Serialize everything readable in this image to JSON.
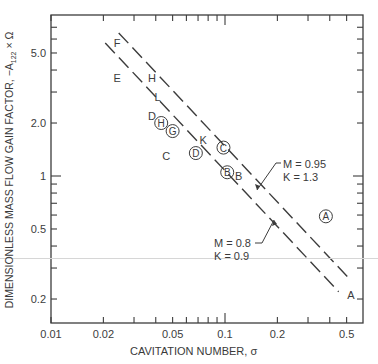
{
  "chart_data": {
    "type": "scatter",
    "title": "",
    "xlabel": "CAVITATION NUMBER, σ",
    "ylabel": "DIMENSIONLESS MASS FLOW GAIN FACTOR, −A122 × Ω",
    "xscale": "log",
    "yscale": "log",
    "xlim": [
      0.01,
      0.6
    ],
    "ylim": [
      0.16,
      8.0
    ],
    "x_ticks": [
      "0.01",
      "0.02",
      "0.05",
      "0.1",
      "0.2",
      "0.5"
    ],
    "y_ticks": [
      "0.2",
      "0.5",
      "1",
      "2.0",
      "5.0"
    ],
    "grid": false,
    "points": [
      {
        "label": "F",
        "circled": false,
        "x": 0.024,
        "y": 5.7
      },
      {
        "label": "E",
        "circled": false,
        "x": 0.024,
        "y": 3.6
      },
      {
        "label": "H",
        "circled": false,
        "x": 0.038,
        "y": 3.6
      },
      {
        "label": "L",
        "circled": false,
        "x": 0.041,
        "y": 2.8
      },
      {
        "label": "D",
        "circled": false,
        "x": 0.038,
        "y": 2.2
      },
      {
        "label": "H",
        "circled": true,
        "x": 0.043,
        "y": 2.0
      },
      {
        "label": "G",
        "circled": true,
        "x": 0.05,
        "y": 1.8
      },
      {
        "label": "K",
        "circled": false,
        "x": 0.075,
        "y": 1.6
      },
      {
        "label": "C",
        "circled": true,
        "x": 0.098,
        "y": 1.45
      },
      {
        "label": "C",
        "circled": false,
        "x": 0.046,
        "y": 1.3
      },
      {
        "label": "D",
        "circled": true,
        "x": 0.068,
        "y": 1.35
      },
      {
        "label": "B",
        "circled": true,
        "x": 0.103,
        "y": 1.05
      },
      {
        "label": "B",
        "circled": false,
        "x": 0.12,
        "y": 1.0
      },
      {
        "label": "A",
        "circled": true,
        "x": 0.38,
        "y": 0.59
      },
      {
        "label": "A",
        "circled": false,
        "x": 0.53,
        "y": 0.21
      }
    ],
    "series": [
      {
        "name": "M = 0.95, K = 1.3",
        "style": "dashed",
        "x": [
          0.0245,
          0.52
        ],
        "y": [
          6.5,
          0.26
        ]
      },
      {
        "name": "M = 0.8, K = 0.9",
        "style": "dashed",
        "x": [
          0.0205,
          0.45
        ],
        "y": [
          5.7,
          0.22
        ]
      }
    ],
    "annotations": [
      {
        "text": "M = 0.95\nK = 1.3",
        "points_to": "upper dashed line"
      },
      {
        "text": "M = 0.8\nK = 0.9",
        "points_to": "lower dashed line"
      }
    ]
  },
  "labels": {
    "xaxis": "CAVITATION NUMBER, σ",
    "yaxis_pre": "DIMENSIONLESS MASS FLOW GAIN FACTOR, −A",
    "yaxis_sub": "122",
    "yaxis_post": " × Ω",
    "ann1_line1": "M = 0.95",
    "ann1_line2": "K = 1.3",
    "ann2_line1": "M = 0.8",
    "ann2_line2": "K = 0.9"
  }
}
